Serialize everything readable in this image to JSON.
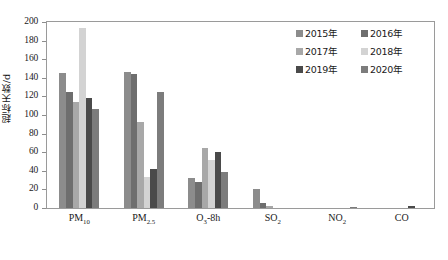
{
  "chart_data": {
    "type": "bar",
    "title": "",
    "xlabel": "",
    "ylabel": "超标天数/d",
    "ylim": [
      0,
      200
    ],
    "ytick_step": 20,
    "grid": false,
    "legend_position": "top-right",
    "categories": [
      "PM10",
      "PM2.5",
      "O3-8h",
      "SO2",
      "NO2",
      "CO"
    ],
    "category_labels": [
      "PM",
      "PM",
      "O",
      "SO",
      "NO",
      "CO"
    ],
    "category_subscripts": [
      "10",
      "2.5",
      "3",
      "2",
      "2",
      ""
    ],
    "category_suffixes": [
      "",
      "",
      "-8h",
      "",
      "",
      ""
    ],
    "ytick_labels": [
      "0",
      "20",
      "40",
      "60",
      "80",
      "100",
      "120",
      "140",
      "160",
      "180",
      "200"
    ],
    "series": [
      {
        "name": "2015年",
        "color": "#8c8c8c",
        "values": [
          145,
          146,
          32,
          20,
          0,
          0
        ]
      },
      {
        "name": "2016年",
        "color": "#6e6e6e",
        "values": [
          125,
          144,
          28,
          5,
          0,
          0
        ]
      },
      {
        "name": "2017年",
        "color": "#a8a8a8",
        "values": [
          114,
          93,
          64,
          2,
          0,
          0
        ]
      },
      {
        "name": "2018年",
        "color": "#d3d3d3",
        "values": [
          194,
          33,
          52,
          0,
          0,
          0
        ]
      },
      {
        "name": "2019年",
        "color": "#4a4a4a",
        "values": [
          118,
          42,
          60,
          0,
          0,
          2
        ]
      },
      {
        "name": "2020年",
        "color": "#7c7c7c",
        "values": [
          106,
          125,
          39,
          0,
          1,
          0
        ]
      }
    ]
  }
}
